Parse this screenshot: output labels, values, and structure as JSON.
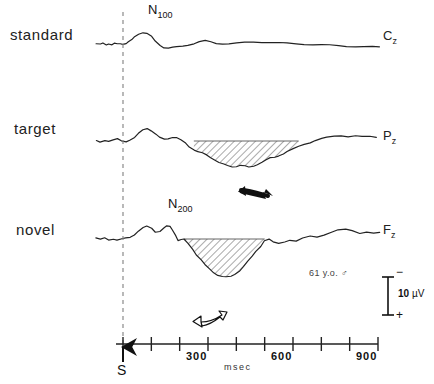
{
  "figure": {
    "subject_note": "61 y.o. ♂",
    "line_color": "#222222",
    "hatch_color": "#555555",
    "dashed_line_color": "#888888"
  },
  "traces": [
    {
      "condition": "standard",
      "electrode": "C",
      "electrode_sub": "z"
    },
    {
      "condition": "target",
      "electrode": "P",
      "electrode_sub": "z"
    },
    {
      "condition": "novel",
      "electrode": "F",
      "electrode_sub": "z"
    }
  ],
  "components": [
    {
      "name": "N",
      "sub": "100"
    },
    {
      "name": "N",
      "sub": "200"
    }
  ],
  "axis": {
    "unit": "msec",
    "stimulus_marker": "S",
    "tick_values": [
      0,
      100,
      200,
      300,
      400,
      500,
      600,
      700,
      800,
      900
    ],
    "labeled_ticks": [
      "300",
      "600",
      "900"
    ]
  },
  "scale_bar": {
    "value": "10",
    "unit": "µV",
    "negative_sign": "−",
    "positive_sign": "+"
  },
  "annotations": {
    "target_arrow": "filled-arrow",
    "novel_arrow": "outline-arrow"
  },
  "chart_data": {
    "type": "line",
    "xlabel": "msec",
    "ylabel": "µV",
    "xlim": [
      -100,
      950
    ],
    "grid": false,
    "legend": "none",
    "scale_uv_per_division": 10,
    "polarity": "negative up",
    "series": [
      {
        "name": "standard",
        "electrode": "Cz",
        "peak_label": "N100",
        "x": [
          -95,
          -80,
          -70,
          -60,
          -50,
          -40,
          -30,
          -20,
          -10,
          0,
          10,
          20,
          30,
          40,
          55,
          70,
          85,
          100,
          115,
          130,
          145,
          160,
          175,
          190,
          210,
          230,
          250,
          270,
          290,
          310,
          330,
          350,
          375,
          400,
          430,
          460,
          490,
          520,
          550,
          580,
          610,
          640,
          670,
          700,
          730,
          760,
          790,
          820,
          850,
          880,
          905
        ],
        "y": [
          0.2,
          -0.4,
          0.5,
          -0.6,
          0.4,
          -0.5,
          0.3,
          -0.2,
          0.2,
          0.1,
          0.6,
          1.5,
          3.0,
          5.2,
          7.8,
          9.0,
          8.2,
          5.5,
          2.0,
          -1.0,
          -2.6,
          -3.0,
          -2.8,
          -2.4,
          -1.6,
          -0.6,
          0.4,
          1.6,
          2.4,
          1.6,
          0.6,
          0.2,
          0.1,
          0.5,
          1.2,
          1.6,
          1.5,
          1.2,
          0.8,
          0.5,
          0.2,
          -0.1,
          -0.4,
          -0.7,
          -1.0,
          -1.3,
          -1.6,
          -1.9,
          -2.1,
          -2.3,
          -2.4
        ]
      },
      {
        "name": "target",
        "electrode": "Pz",
        "shaded_window_ms": [
          250,
          620
        ],
        "arrow": "filled",
        "x": [
          -95,
          -80,
          -65,
          -50,
          -35,
          -20,
          -5,
          10,
          25,
          40,
          55,
          70,
          85,
          100,
          115,
          130,
          145,
          160,
          175,
          190,
          205,
          220,
          235,
          250,
          265,
          280,
          295,
          310,
          325,
          340,
          355,
          370,
          385,
          400,
          415,
          430,
          445,
          460,
          475,
          490,
          505,
          520,
          535,
          550,
          565,
          580,
          600,
          620,
          640,
          660,
          680,
          700,
          720,
          745,
          770,
          795,
          820,
          845,
          870,
          895
        ],
        "y": [
          0.3,
          -0.5,
          0.6,
          -0.4,
          0.5,
          1.6,
          0.4,
          -0.3,
          0.6,
          2.4,
          5.6,
          8.8,
          10.0,
          8.0,
          5.0,
          2.6,
          1.4,
          2.0,
          3.0,
          2.4,
          0.6,
          -1.8,
          -4.4,
          -6.6,
          -8.2,
          -9.4,
          -11.0,
          -12.8,
          -14.6,
          -16.4,
          -18.0,
          -19.2,
          -20.0,
          -19.4,
          -18.4,
          -19.2,
          -20.4,
          -19.6,
          -18.0,
          -16.0,
          -14.4,
          -13.2,
          -12.8,
          -11.4,
          -9.6,
          -8.0,
          -6.2,
          -4.4,
          -2.6,
          -1.0,
          0.6,
          1.8,
          2.6,
          3.6,
          4.2,
          3.6,
          4.0,
          3.2,
          3.4,
          3.0
        ]
      },
      {
        "name": "novel",
        "electrode": "Fz",
        "peak_label": "N200",
        "shaded_window_ms": [
          215,
          500
        ],
        "arrow": "outline",
        "x": [
          -95,
          -80,
          -65,
          -50,
          -35,
          -20,
          -5,
          10,
          25,
          40,
          55,
          70,
          85,
          100,
          115,
          130,
          145,
          155,
          165,
          175,
          185,
          195,
          205,
          215,
          230,
          245,
          260,
          275,
          290,
          305,
          320,
          335,
          350,
          365,
          380,
          395,
          410,
          425,
          440,
          455,
          470,
          485,
          500,
          515,
          530,
          550,
          570,
          590,
          610,
          635,
          660,
          685,
          710,
          735,
          760,
          785,
          810,
          835,
          860,
          885,
          905
        ],
        "y": [
          1.0,
          -0.4,
          0.6,
          -0.8,
          0.2,
          -0.6,
          0.0,
          0.4,
          1.2,
          3.4,
          6.4,
          8.8,
          9.6,
          8.0,
          5.4,
          6.2,
          8.8,
          9.8,
          9.4,
          7.2,
          3.0,
          -1.0,
          -0.6,
          -0.4,
          -3.4,
          -7.6,
          -12.0,
          -16.2,
          -20.0,
          -23.2,
          -25.8,
          -27.6,
          -28.8,
          -29.4,
          -29.0,
          -27.2,
          -24.4,
          -21.0,
          -17.4,
          -13.6,
          -9.6,
          -5.4,
          -1.0,
          -0.2,
          -2.6,
          -3.6,
          -2.0,
          -0.6,
          -1.6,
          0.4,
          2.0,
          1.6,
          3.4,
          5.4,
          6.8,
          7.2,
          6.4,
          4.6,
          5.6,
          4.4,
          4.6
        ]
      }
    ]
  }
}
